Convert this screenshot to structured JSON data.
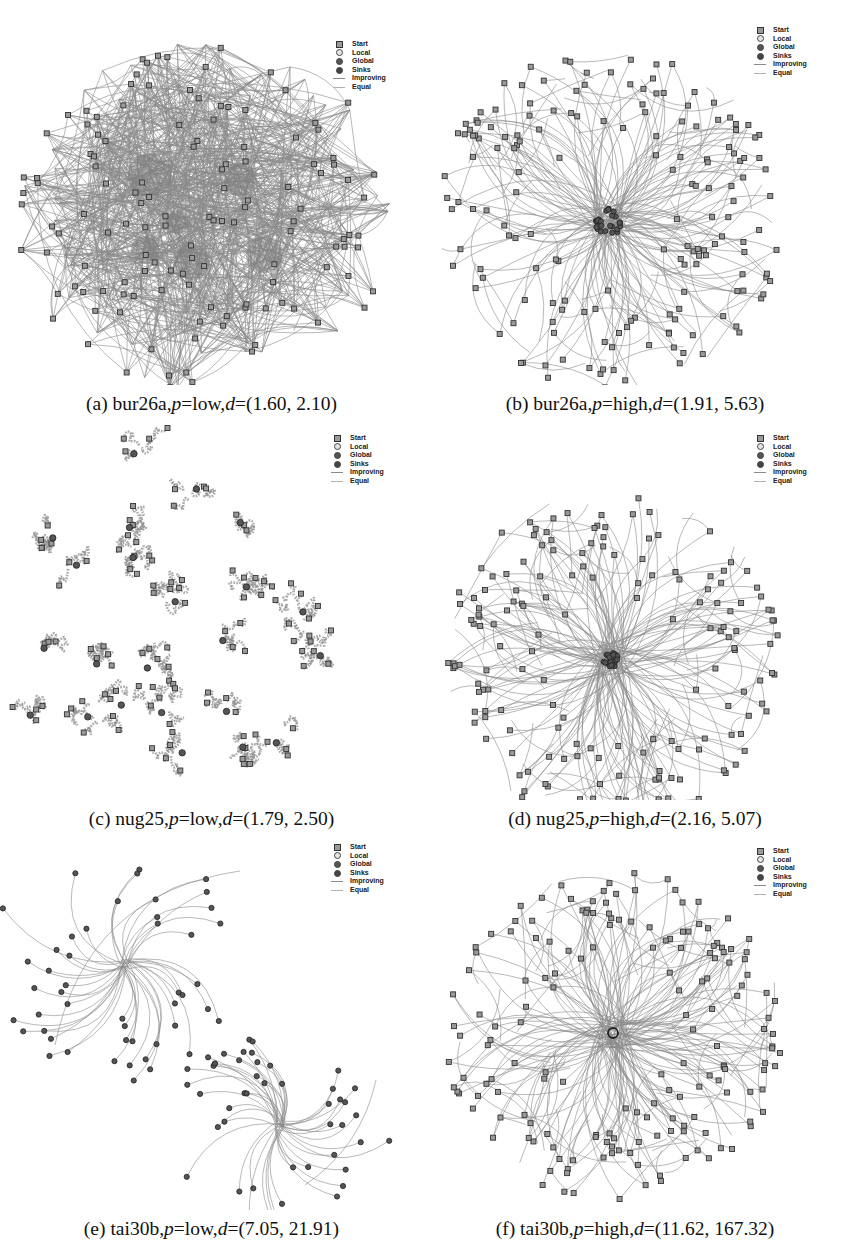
{
  "figure": {
    "legend": {
      "items": [
        {
          "label": "Start",
          "symbol": "square",
          "fill": "#9a9a9a"
        },
        {
          "label": "Local",
          "symbol": "circle",
          "fill": "#e6e6e6"
        },
        {
          "label": "Global",
          "symbol": "circle",
          "fill": "#555555"
        },
        {
          "label": "Sinks",
          "symbol": "circle",
          "fill": "#444444"
        },
        {
          "label": "Improving",
          "symbol": "line",
          "fill": "#8a8a8a"
        },
        {
          "label": "Equal",
          "symbol": "line",
          "fill": "#b0b0b0"
        }
      ]
    },
    "panels": [
      {
        "id": "a",
        "letter": "(a)",
        "instance": "bur26a",
        "p": "low",
        "d": "(1.60, 2.10)",
        "x": 0,
        "y": 0,
        "w": 423,
        "h": 395,
        "legend_x": 332,
        "legend_y": 40,
        "layout": "dense",
        "seed": 11,
        "cx": 205,
        "cy": 215,
        "r": 185,
        "sink": {
          "x": 199,
          "y": 182,
          "r": 12
        }
      },
      {
        "id": "b",
        "letter": "(b)",
        "instance": "bur26a",
        "p": "high",
        "d": "(1.91, 5.63)",
        "x": 423,
        "y": 0,
        "w": 424,
        "h": 395,
        "legend_x": 330,
        "legend_y": 26,
        "layout": "radial",
        "seed": 23,
        "cx": 185,
        "cy": 220,
        "r": 175,
        "sink": {
          "x": 185,
          "y": 222,
          "r": 14
        }
      },
      {
        "id": "c",
        "letter": "(c)",
        "instance": "nug25",
        "p": "low",
        "d": "(1.79, 2.50)",
        "x": 0,
        "y": 420,
        "w": 423,
        "h": 390,
        "legend_x": 330,
        "legend_y": 14,
        "layout": "clusters",
        "seed": 37
      },
      {
        "id": "d",
        "letter": "(d)",
        "instance": "nug25",
        "p": "high",
        "d": "(2.16, 5.07)",
        "x": 423,
        "y": 420,
        "w": 424,
        "h": 390,
        "legend_x": 330,
        "legend_y": 14,
        "layout": "radial",
        "seed": 41,
        "cx": 188,
        "cy": 240,
        "r": 170,
        "sink": {
          "x": 188,
          "y": 240,
          "r": 8
        }
      },
      {
        "id": "e",
        "letter": "(e)",
        "instance": "tai30b",
        "p": "low",
        "d": "(7.05, 21.91)",
        "x": 0,
        "y": 835,
        "w": 423,
        "h": 385,
        "legend_x": 330,
        "legend_y": 8,
        "layout": "twostars",
        "seed": 53
      },
      {
        "id": "f",
        "letter": "(f)",
        "instance": "tai30b",
        "p": "high",
        "d": "(11.62, 167.32)",
        "x": 423,
        "y": 835,
        "w": 424,
        "h": 385,
        "legend_x": 330,
        "legend_y": 12,
        "layout": "radial",
        "seed": 67,
        "cx": 190,
        "cy": 200,
        "r": 170,
        "sink": {
          "x": 190,
          "y": 198,
          "r": 5
        }
      }
    ]
  }
}
